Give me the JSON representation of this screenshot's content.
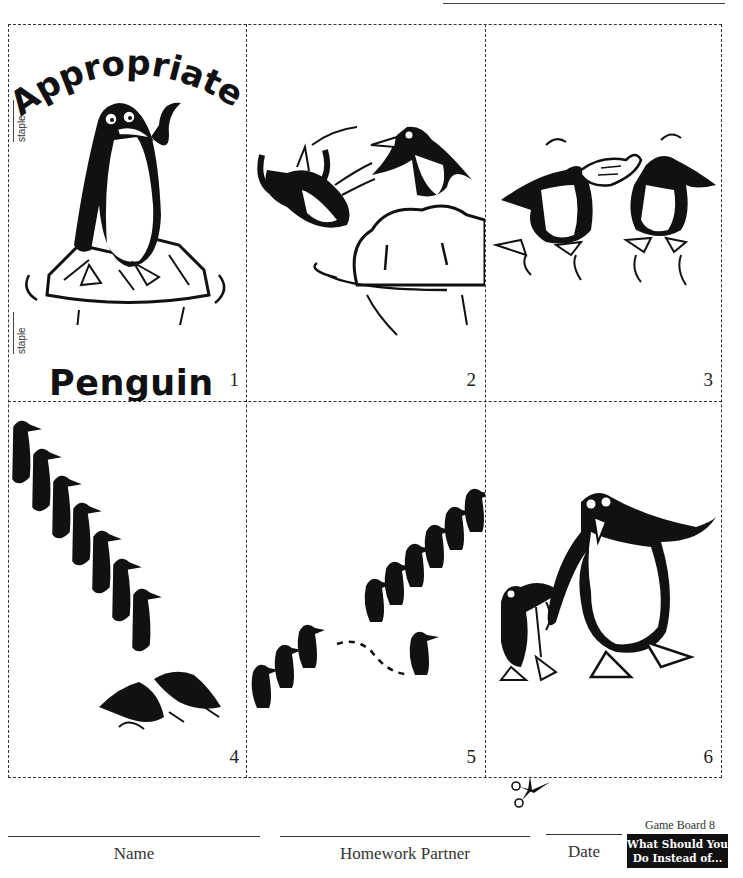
{
  "page": {
    "title_top": "Appropriate",
    "title_bottom": "Penguin",
    "staple_labels": [
      "staple",
      "staple"
    ]
  },
  "panels": [
    {
      "number": "1",
      "scene": "cover: penguin waving on ice floe"
    },
    {
      "number": "2",
      "scene": "penguin pushing another penguin off iceberg"
    },
    {
      "number": "3",
      "scene": "two penguins fighting over a fish"
    },
    {
      "number": "4",
      "scene": "line of penguins, one pushing another out of line"
    },
    {
      "number": "5",
      "scene": "line of penguins, one cutting in line"
    },
    {
      "number": "6",
      "scene": "large penguin and small penguin waving"
    }
  ],
  "footer": {
    "fields": [
      {
        "label": "Name"
      },
      {
        "label": "Homework Partner"
      },
      {
        "label": "Date"
      }
    ],
    "game_board": {
      "label": "Game Board 8",
      "badge_line1": "What Should You",
      "badge_line2": "Do Instead of..."
    }
  },
  "colors": {
    "ink": "#111111",
    "paper": "#ffffff",
    "dash": "#333333"
  }
}
